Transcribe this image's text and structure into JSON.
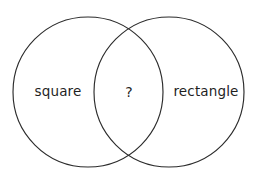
{
  "diagram": {
    "type": "venn-two-set",
    "background_color": "#ffffff",
    "stroke_color": "#2b2b2b",
    "text_color": "#1f1f1f",
    "width": 257,
    "height": 182,
    "sets": [
      {
        "id": "left",
        "label": "square",
        "center_x": 88,
        "center_y": 92,
        "radius": 75
      },
      {
        "id": "right",
        "label": "rectangle",
        "center_x": 169,
        "center_y": 92,
        "radius": 75
      }
    ],
    "intersection": {
      "label": "?",
      "center_x": 129,
      "center_y": 92
    }
  }
}
